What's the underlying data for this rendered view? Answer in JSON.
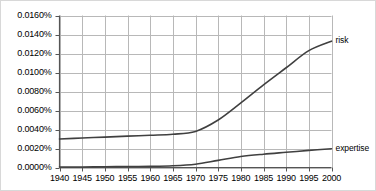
{
  "chart_data": {
    "type": "line",
    "title": "",
    "xlabel": "",
    "ylabel": "",
    "xlim": [
      1940,
      2000
    ],
    "ylim": [
      0.0,
      0.016
    ],
    "grid": true,
    "legend_position": "right-inline",
    "y_tick_format": "percent-4dp",
    "categories": [
      1940,
      1945,
      1950,
      1955,
      1960,
      1965,
      1970,
      1975,
      1980,
      1985,
      1990,
      1995,
      2000
    ],
    "x_tick_labels": [
      "1940",
      "1945",
      "1950",
      "1955",
      "1960",
      "1965",
      "1970",
      "1975",
      "1980",
      "1985",
      "1990",
      "1995",
      "2000"
    ],
    "y_tick_values": [
      0.0,
      0.002,
      0.004,
      0.006,
      0.008,
      0.01,
      0.012,
      0.014,
      0.016
    ],
    "y_tick_labels": [
      "0.0000%",
      "0.0020%",
      "0.0040%",
      "0.0060%",
      "0.0080%",
      "0.0100%",
      "0.0120%",
      "0.0140%",
      "0.0160%"
    ],
    "x": [
      1940,
      1945,
      1950,
      1955,
      1960,
      1965,
      1970,
      1975,
      1980,
      1985,
      1990,
      1995,
      2000
    ],
    "series": [
      {
        "name": "risk",
        "color": "#404040",
        "values": [
          0.003,
          0.0031,
          0.0032,
          0.0033,
          0.0034,
          0.0035,
          0.0038,
          0.005,
          0.0068,
          0.0087,
          0.0105,
          0.0123,
          0.0133
        ]
      },
      {
        "name": "expertise",
        "color": "#404040",
        "values": [
          5e-05,
          6e-05,
          8e-05,
          0.0001,
          0.00012,
          0.00018,
          0.00035,
          0.00075,
          0.00115,
          0.0014,
          0.0016,
          0.0018,
          0.00198
        ]
      }
    ]
  },
  "axis": {
    "y_labels": [
      "0.0160%",
      "0.0140%",
      "0.0120%",
      "0.0100%",
      "0.0080%",
      "0.0060%",
      "0.0040%",
      "0.0020%",
      "0.0000%"
    ],
    "x_labels": [
      "1940",
      "1945",
      "1950",
      "1955",
      "1960",
      "1965",
      "1970",
      "1975",
      "1980",
      "1985",
      "1990",
      "1995",
      "2000"
    ]
  },
  "series_labels": {
    "risk": "risk",
    "expertise": "expertise"
  },
  "colors": {
    "line": "#404040",
    "grid": "#b8b8b8",
    "axis": "#555555",
    "border": "#d8d8d8",
    "text": "#000000"
  }
}
